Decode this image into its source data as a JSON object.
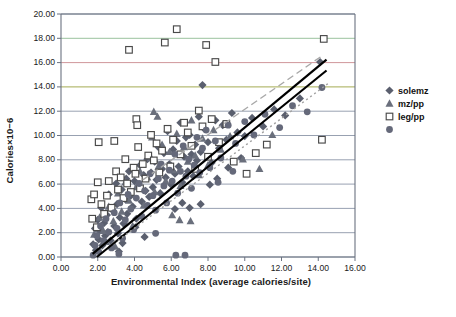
{
  "chart_data": {
    "type": "scatter",
    "title": "",
    "xlabel": "Environmental Index (average calories/site)",
    "ylabel": "Calories×10−6",
    "xlim": [
      0.0,
      16.0
    ],
    "ylim": [
      0.0,
      20.0
    ],
    "xticks": [
      "0.00",
      "2.00",
      "4.00",
      "6.00",
      "8.00",
      "10.00",
      "12.00",
      "14.00",
      "16.00"
    ],
    "yticks": [
      "0.00",
      "2.00",
      "4.00",
      "6.00",
      "8.00",
      "10.00",
      "12.00",
      "14.00",
      "16.00",
      "18.00",
      "20.00"
    ],
    "grid": "horizontal",
    "legend_position": "right",
    "gridline_colors": {
      "default": "#8c96a8",
      "14.00": "#9aa33f",
      "16.00": "#c98a8f",
      "18.00": "#8fbb93"
    },
    "series": [
      {
        "name": "solemz",
        "marker": "diamond",
        "color": "#5a5f6e",
        "points": [
          [
            1.75,
            1.05
          ],
          [
            1.85,
            2.35
          ],
          [
            1.9,
            0.55
          ],
          [
            2.0,
            3.05
          ],
          [
            2.05,
            1.45
          ],
          [
            2.1,
            2.15
          ],
          [
            2.2,
            4.05
          ],
          [
            2.25,
            0.95
          ],
          [
            2.35,
            2.8
          ],
          [
            2.4,
            1.75
          ],
          [
            2.5,
            3.45
          ],
          [
            2.55,
            2.05
          ],
          [
            2.6,
            5.15
          ],
          [
            2.7,
            1.35
          ],
          [
            2.8,
            3.85
          ],
          [
            2.9,
            2.55
          ],
          [
            3.0,
            6.05
          ],
          [
            3.05,
            4.35
          ],
          [
            3.1,
            1.95
          ],
          [
            3.2,
            3.25
          ],
          [
            3.3,
            5.55
          ],
          [
            3.4,
            2.75
          ],
          [
            3.5,
            4.75
          ],
          [
            3.55,
            6.45
          ],
          [
            3.6,
            3.55
          ],
          [
            3.7,
            7.05
          ],
          [
            3.8,
            5.05
          ],
          [
            3.9,
            4.15
          ],
          [
            4.0,
            6.25
          ],
          [
            4.1,
            3.15
          ],
          [
            4.2,
            5.85
          ],
          [
            4.3,
            7.55
          ],
          [
            4.4,
            4.55
          ],
          [
            4.5,
            6.75
          ],
          [
            4.6,
            5.45
          ],
          [
            4.7,
            8.05
          ],
          [
            4.8,
            4.95
          ],
          [
            4.9,
            6.95
          ],
          [
            5.0,
            5.75
          ],
          [
            5.1,
            7.85
          ],
          [
            5.2,
            6.35
          ],
          [
            5.3,
            9.05
          ],
          [
            5.4,
            5.25
          ],
          [
            5.5,
            7.25
          ],
          [
            5.6,
            8.55
          ],
          [
            5.7,
            6.55
          ],
          [
            5.8,
            10.35
          ],
          [
            5.9,
            7.65
          ],
          [
            6.0,
            5.95
          ],
          [
            6.1,
            8.85
          ],
          [
            6.2,
            6.85
          ],
          [
            6.3,
            9.55
          ],
          [
            6.4,
            7.45
          ],
          [
            6.5,
            11.05
          ],
          [
            6.6,
            6.15
          ],
          [
            6.7,
            8.25
          ],
          [
            6.8,
            9.85
          ],
          [
            6.9,
            7.05
          ],
          [
            7.0,
            10.05
          ],
          [
            7.1,
            8.45
          ],
          [
            7.2,
            6.65
          ],
          [
            7.3,
            9.25
          ],
          [
            7.4,
            7.95
          ],
          [
            7.5,
            11.55
          ],
          [
            7.6,
            8.65
          ],
          [
            7.7,
            14.15
          ],
          [
            7.8,
            10.55
          ],
          [
            8.0,
            9.45
          ],
          [
            8.2,
            7.75
          ],
          [
            8.4,
            11.25
          ],
          [
            8.6,
            8.95
          ],
          [
            8.8,
            10.85
          ],
          [
            9.0,
            9.65
          ],
          [
            9.3,
            11.85
          ],
          [
            9.6,
            10.25
          ],
          [
            10.0,
            9.95
          ],
          [
            10.4,
            11.45
          ],
          [
            11.0,
            10.75
          ],
          [
            11.6,
            12.15
          ],
          [
            12.2,
            11.65
          ],
          [
            13.0,
            13.05
          ],
          [
            14.1,
            16.05
          ],
          [
            6.2,
            3.95
          ],
          [
            6.6,
            4.45
          ],
          [
            7.0,
            4.05
          ],
          [
            7.6,
            4.35
          ],
          [
            8.1,
            5.95
          ],
          [
            8.5,
            6.45
          ],
          [
            9.1,
            7.35
          ],
          [
            9.8,
            8.15
          ],
          [
            3.15,
            0.45
          ],
          [
            3.35,
            1.15
          ],
          [
            4.05,
            2.45
          ],
          [
            4.55,
            1.65
          ]
        ]
      },
      {
        "name": "mz/pp",
        "marker": "triangle",
        "color": "#6a6f7c",
        "points": [
          [
            1.8,
            1.85
          ],
          [
            2.1,
            3.25
          ],
          [
            2.3,
            2.15
          ],
          [
            2.6,
            4.15
          ],
          [
            2.85,
            2.95
          ],
          [
            3.1,
            5.25
          ],
          [
            3.3,
            3.75
          ],
          [
            3.5,
            6.15
          ],
          [
            3.7,
            4.65
          ],
          [
            3.9,
            2.55
          ],
          [
            4.1,
            5.75
          ],
          [
            4.3,
            7.05
          ],
          [
            4.5,
            4.25
          ],
          [
            4.7,
            6.55
          ],
          [
            4.9,
            8.15
          ],
          [
            5.1,
            5.35
          ],
          [
            5.3,
            7.45
          ],
          [
            5.5,
            9.25
          ],
          [
            5.7,
            6.25
          ],
          [
            5.9,
            8.65
          ],
          [
            6.1,
            7.15
          ],
          [
            6.3,
            10.15
          ],
          [
            6.5,
            5.85
          ],
          [
            6.7,
            9.05
          ],
          [
            6.9,
            7.85
          ],
          [
            7.1,
            11.25
          ],
          [
            7.3,
            8.35
          ],
          [
            7.5,
            6.75
          ],
          [
            7.7,
            9.75
          ],
          [
            8.0,
            7.55
          ],
          [
            8.3,
            10.45
          ],
          [
            8.7,
            8.85
          ],
          [
            9.2,
            9.95
          ],
          [
            9.9,
            8.05
          ],
          [
            10.8,
            7.25
          ],
          [
            11.5,
            10.05
          ],
          [
            5.05,
            11.95
          ],
          [
            5.25,
            11.55
          ],
          [
            4.95,
            9.85
          ],
          [
            2.45,
            1.25
          ],
          [
            2.95,
            0.85
          ],
          [
            6.05,
            3.45
          ],
          [
            6.45,
            3.05
          ],
          [
            7.05,
            2.95
          ]
        ]
      },
      {
        "name": "leg/pp",
        "marker": "square-open",
        "color": "#4a4a4a",
        "points": [
          [
            1.65,
            4.75
          ],
          [
            1.7,
            3.15
          ],
          [
            1.8,
            5.15
          ],
          [
            1.95,
            2.45
          ],
          [
            2.0,
            6.15
          ],
          [
            2.2,
            4.35
          ],
          [
            2.35,
            3.55
          ],
          [
            2.5,
            5.05
          ],
          [
            2.6,
            6.25
          ],
          [
            2.75,
            4.05
          ],
          [
            2.9,
            9.55
          ],
          [
            3.0,
            7.05
          ],
          [
            3.1,
            5.55
          ],
          [
            3.25,
            6.55
          ],
          [
            3.4,
            4.85
          ],
          [
            3.5,
            8.05
          ],
          [
            3.6,
            6.05
          ],
          [
            3.7,
            17.05
          ],
          [
            3.8,
            5.35
          ],
          [
            3.95,
            7.35
          ],
          [
            4.05,
            6.85
          ],
          [
            4.2,
            9.05
          ],
          [
            4.3,
            5.65
          ],
          [
            4.45,
            7.65
          ],
          [
            4.6,
            6.45
          ],
          [
            4.75,
            8.35
          ],
          [
            4.9,
            10.05
          ],
          [
            5.05,
            7.95
          ],
          [
            5.2,
            9.35
          ],
          [
            5.35,
            6.95
          ],
          [
            5.5,
            8.75
          ],
          [
            5.65,
            17.65
          ],
          [
            5.8,
            10.55
          ],
          [
            5.95,
            7.45
          ],
          [
            6.1,
            9.65
          ],
          [
            6.3,
            18.75
          ],
          [
            6.5,
            8.45
          ],
          [
            6.7,
            11.05
          ],
          [
            6.9,
            10.25
          ],
          [
            7.1,
            9.15
          ],
          [
            7.3,
            7.25
          ],
          [
            7.5,
            12.05
          ],
          [
            7.7,
            10.75
          ],
          [
            7.9,
            17.45
          ],
          [
            8.0,
            8.25
          ],
          [
            8.2,
            11.35
          ],
          [
            8.4,
            16.05
          ],
          [
            8.6,
            9.45
          ],
          [
            9.0,
            10.95
          ],
          [
            9.4,
            7.85
          ],
          [
            10.1,
            6.85
          ],
          [
            10.6,
            8.55
          ],
          [
            11.2,
            9.25
          ],
          [
            14.3,
            17.95
          ],
          [
            14.2,
            9.65
          ],
          [
            4.1,
            11.35
          ],
          [
            4.15,
            10.85
          ],
          [
            2.05,
            9.45
          ]
        ]
      },
      {
        "name": "",
        "marker": "circle",
        "color": "#65697a",
        "points": [
          [
            1.75,
            0.15
          ],
          [
            1.85,
            0.95
          ],
          [
            1.95,
            1.75
          ],
          [
            2.05,
            0.45
          ],
          [
            2.15,
            2.55
          ],
          [
            2.3,
            1.35
          ],
          [
            2.45,
            3.15
          ],
          [
            2.6,
            2.05
          ],
          [
            2.75,
            0.75
          ],
          [
            2.9,
            3.65
          ],
          [
            3.05,
            2.35
          ],
          [
            3.2,
            4.45
          ],
          [
            3.35,
            1.55
          ],
          [
            3.5,
            3.05
          ],
          [
            3.65,
            5.15
          ],
          [
            3.8,
            3.95
          ],
          [
            3.95,
            2.25
          ],
          [
            4.1,
            4.85
          ],
          [
            4.25,
            6.05
          ],
          [
            4.4,
            3.35
          ],
          [
            4.55,
            5.45
          ],
          [
            4.7,
            4.25
          ],
          [
            4.85,
            6.85
          ],
          [
            5.0,
            5.05
          ],
          [
            5.15,
            3.85
          ],
          [
            5.3,
            6.45
          ],
          [
            5.45,
            7.65
          ],
          [
            5.6,
            5.85
          ],
          [
            5.75,
            4.45
          ],
          [
            5.9,
            7.15
          ],
          [
            6.05,
            6.25
          ],
          [
            6.2,
            8.45
          ],
          [
            6.35,
            5.25
          ],
          [
            6.5,
            7.05
          ],
          [
            6.65,
            9.15
          ],
          [
            6.8,
            6.65
          ],
          [
            6.95,
            8.05
          ],
          [
            7.1,
            5.65
          ],
          [
            7.25,
            7.55
          ],
          [
            7.4,
            9.85
          ],
          [
            7.55,
            6.95
          ],
          [
            7.7,
            8.95
          ],
          [
            7.9,
            10.45
          ],
          [
            8.1,
            7.35
          ],
          [
            8.4,
            9.55
          ],
          [
            8.7,
            8.15
          ],
          [
            9.1,
            10.85
          ],
          [
            9.5,
            9.35
          ],
          [
            10.0,
            11.15
          ],
          [
            10.5,
            10.05
          ],
          [
            11.1,
            11.75
          ],
          [
            11.9,
            10.65
          ],
          [
            12.6,
            12.45
          ],
          [
            13.4,
            11.95
          ],
          [
            14.2,
            13.95
          ],
          [
            3.15,
            0.25
          ],
          [
            6.25,
            0.15
          ],
          [
            6.75,
            0.15
          ],
          [
            5.15,
            1.95
          ],
          [
            8.55,
            6.15
          ],
          [
            9.35,
            7.05
          ]
        ]
      }
    ],
    "trendlines": [
      {
        "name": "solid-upper",
        "style": "solid",
        "color": "#000000",
        "width": 2.2,
        "x0": 1.72,
        "y0": 0.25,
        "x1": 14.45,
        "y1": 16.25
      },
      {
        "name": "solid-lower",
        "style": "solid",
        "color": "#000000",
        "width": 2.2,
        "x0": 1.95,
        "y0": 0.0,
        "x1": 14.45,
        "y1": 15.35
      },
      {
        "name": "dashed-upper",
        "style": "dashed",
        "color": "#a8a8a8",
        "width": 1.4,
        "x0": 4.45,
        "y0": 6.35,
        "x1": 14.2,
        "y1": 16.55
      },
      {
        "name": "dotted-lower",
        "style": "dotted",
        "color": "#a0a0a0",
        "width": 1.4,
        "x0": 3.1,
        "y0": 1.35,
        "x1": 14.6,
        "y1": 14.35
      }
    ]
  },
  "legend": {
    "items": [
      {
        "label": "solemz",
        "marker": "diamond"
      },
      {
        "label": "mz/pp",
        "marker": "triangle"
      },
      {
        "label": "leg/pp",
        "marker": "square-open"
      },
      {
        "label": "",
        "marker": "circle"
      }
    ]
  }
}
